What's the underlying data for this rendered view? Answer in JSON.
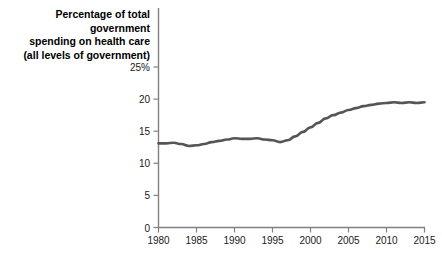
{
  "chart_data": {
    "type": "line",
    "title": "Percentage of total government\nspending on health care\n(all levels of government)",
    "xlabel": "",
    "ylabel": "",
    "xlim": [
      1980,
      2015
    ],
    "ylim": [
      0,
      25
    ],
    "grid": false,
    "legend": null,
    "line_color": "#555555",
    "axis_color": "#808080",
    "y_ticks": [
      0,
      5,
      10,
      15,
      20,
      25
    ],
    "y_tick_labels": [
      "0",
      "5",
      "10",
      "15",
      "20",
      "25%"
    ],
    "x_ticks": [
      1980,
      1985,
      1990,
      1995,
      2000,
      2005,
      2010,
      2015
    ],
    "x_tick_labels": [
      "1980",
      "1985",
      "1990",
      "1995",
      "2000",
      "2005",
      "2010",
      "2015"
    ],
    "series": [
      {
        "name": "Percentage of total government spending on health care",
        "x": [
          1980,
          1981,
          1982,
          1983,
          1984,
          1985,
          1986,
          1987,
          1988,
          1989,
          1990,
          1991,
          1992,
          1993,
          1994,
          1995,
          1996,
          1997,
          1998,
          1999,
          2000,
          2001,
          2002,
          2003,
          2004,
          2005,
          2006,
          2007,
          2008,
          2009,
          2010,
          2011,
          2012,
          2013,
          2014,
          2015
        ],
        "values": [
          13.1,
          13.1,
          13.2,
          13.0,
          12.7,
          12.8,
          13.0,
          13.3,
          13.5,
          13.7,
          13.9,
          13.8,
          13.8,
          13.9,
          13.7,
          13.6,
          13.3,
          13.6,
          14.2,
          14.9,
          15.6,
          16.3,
          17.0,
          17.5,
          17.9,
          18.3,
          18.6,
          18.9,
          19.1,
          19.3,
          19.4,
          19.5,
          19.4,
          19.5,
          19.4,
          19.5
        ]
      }
    ]
  },
  "axes": {
    "y_axis_name": "y-axis",
    "x_axis_name": "x-axis"
  }
}
